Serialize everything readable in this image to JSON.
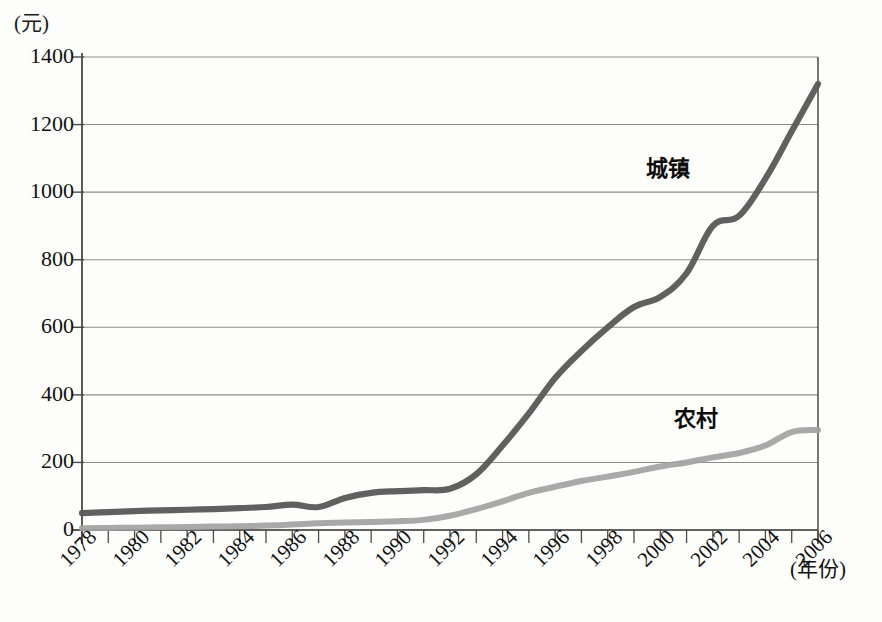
{
  "figure": {
    "unit_label": "(元)",
    "x_axis_title": "(年份)"
  },
  "chart_data": {
    "type": "line",
    "title": "",
    "subtitle": "",
    "xlabel": "(年份)",
    "ylabel": "(元)",
    "xlim": [
      1978,
      2006
    ],
    "ylim": [
      0,
      1400
    ],
    "grid": true,
    "grid_axis": "y",
    "legend_position": "inline-annotation",
    "y_ticks": [
      0,
      200,
      400,
      600,
      800,
      1000,
      1200,
      1400
    ],
    "y_tick_labels": [
      "0",
      "200",
      "400",
      "600",
      "800",
      "1000",
      "1200",
      "1400"
    ],
    "x_ticks": [
      1978,
      1979,
      1980,
      1981,
      1982,
      1983,
      1984,
      1985,
      1986,
      1987,
      1988,
      1989,
      1990,
      1991,
      1992,
      1993,
      1994,
      1995,
      1996,
      1997,
      1998,
      1999,
      2000,
      2001,
      2002,
      2003,
      2004,
      2005,
      2006
    ],
    "x_tick_labels": [
      "1978",
      "1980",
      "1982",
      "1984",
      "1986",
      "1988",
      "1990",
      "1992",
      "1994",
      "1996",
      "1998",
      "2000",
      "2002",
      "2004",
      "2006"
    ],
    "x_tick_label_years": [
      1978,
      1980,
      1982,
      1984,
      1986,
      1988,
      1990,
      1992,
      1994,
      1996,
      1998,
      2000,
      2002,
      2004,
      2006
    ],
    "x": [
      1978,
      1979,
      1980,
      1981,
      1982,
      1983,
      1984,
      1985,
      1986,
      1987,
      1988,
      1989,
      1990,
      1991,
      1992,
      1993,
      1994,
      1995,
      1996,
      1997,
      1998,
      1999,
      2000,
      2001,
      2002,
      2003,
      2004,
      2005,
      2006
    ],
    "series": [
      {
        "name": "城镇",
        "color": "#5a5a5a",
        "values": [
          50,
          53,
          56,
          58,
          60,
          62,
          65,
          68,
          75,
          68,
          95,
          110,
          115,
          118,
          122,
          165,
          250,
          345,
          450,
          530,
          600,
          660,
          690,
          760,
          900,
          930,
          1040,
          1180,
          1320
        ]
      },
      {
        "name": "农村",
        "color": "#a2a2a2",
        "values": [
          5,
          6,
          7,
          8,
          9,
          10,
          11,
          13,
          16,
          20,
          22,
          24,
          26,
          30,
          42,
          62,
          85,
          110,
          128,
          145,
          158,
          172,
          188,
          200,
          215,
          228,
          250,
          290,
          296
        ]
      }
    ],
    "annotations": [
      {
        "text": "城镇",
        "x": 2001,
        "y": 1060
      },
      {
        "text": "农村",
        "x": 2002,
        "y": 360
      }
    ]
  }
}
